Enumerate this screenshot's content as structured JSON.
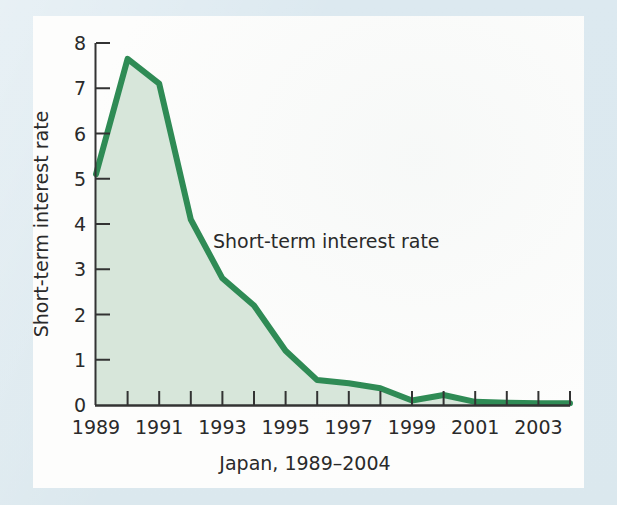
{
  "figure": {
    "mat_color": "#dce9ef",
    "canvas_color": "#fdfdfc"
  },
  "chart_data": {
    "type": "area",
    "title": "",
    "subtitle": "",
    "xlabel": "Japan, 1989–2004",
    "ylabel": "Short-term interest rate",
    "series_name": "Short-term interest rate",
    "annotation": "Short-term interest rate",
    "line_color": "#2f8b55",
    "fill_color": "#d7e6da",
    "grid": false,
    "legend_position": "inline-annotation",
    "xlim": [
      1989,
      2004
    ],
    "ylim": [
      0,
      8
    ],
    "x": [
      1989,
      1990,
      1991,
      1992,
      1993,
      1994,
      1995,
      1996,
      1997,
      1998,
      1999,
      2000,
      2001,
      2002,
      2003,
      2004
    ],
    "values": [
      5.1,
      7.65,
      7.1,
      4.1,
      2.8,
      2.2,
      1.2,
      0.55,
      0.48,
      0.37,
      0.1,
      0.22,
      0.07,
      0.05,
      0.04,
      0.04
    ],
    "x_tick_labels": [
      "1989",
      "1991",
      "1993",
      "1995",
      "1997",
      "1999",
      "2001",
      "2003"
    ],
    "x_tick_values": [
      1989,
      1991,
      1993,
      1995,
      1997,
      1999,
      2001,
      2003
    ],
    "x_minor_ticks": [
      1990,
      1992,
      1994,
      1996,
      1998,
      2000,
      2002,
      2004
    ],
    "y_tick_labels": [
      "0",
      "1",
      "2",
      "3",
      "4",
      "5",
      "6",
      "7",
      "8"
    ],
    "y_tick_values": [
      0,
      1,
      2,
      3,
      4,
      5,
      6,
      7,
      8
    ]
  }
}
